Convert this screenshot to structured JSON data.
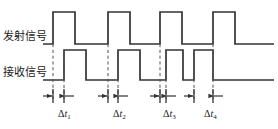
{
  "figure": {
    "background_color": "#ffffff",
    "stroke_color": "#333333",
    "dashed_color": "#555555"
  },
  "signals": {
    "transmit": {
      "label": "发射信号",
      "name": "transmit-signal",
      "baseline_y": 44,
      "high_y": 12,
      "start_x": 43,
      "end_x": 274,
      "pulses": [
        {
          "rise_x": 53,
          "fall_x": 75
        },
        {
          "rise_x": 108,
          "fall_x": 130
        },
        {
          "rise_x": 160,
          "fall_x": 182
        },
        {
          "rise_x": 213,
          "fall_x": 235
        }
      ]
    },
    "receive": {
      "label": "接收信号",
      "name": "receive-signal",
      "baseline_y": 80,
      "high_y": 50,
      "start_x": 43,
      "end_x": 274,
      "pulses": [
        {
          "rise_x": 64,
          "fall_x": 86
        },
        {
          "rise_x": 118,
          "fall_x": 140
        },
        {
          "rise_x": 166,
          "fall_x": 183
        },
        {
          "rise_x": 194,
          "fall_x": 213
        }
      ]
    }
  },
  "dashed_guides": [
    {
      "x": 53,
      "y_top": 44,
      "y_bottom": 99
    },
    {
      "x": 108,
      "y_top": 44,
      "y_bottom": 99
    },
    {
      "x": 160,
      "y_top": 44,
      "y_bottom": 99
    },
    {
      "x": 213,
      "y_top": 44,
      "y_bottom": 99
    },
    {
      "x": 64,
      "y_top": 50,
      "y_bottom": 99
    },
    {
      "x": 118,
      "y_top": 50,
      "y_bottom": 99
    },
    {
      "x": 166,
      "y_top": 50,
      "y_bottom": 99
    },
    {
      "x": 194,
      "y_top": 50,
      "y_bottom": 99
    }
  ],
  "dimension_row": {
    "y": 96,
    "ticks": [
      53,
      64,
      108,
      118,
      160,
      166,
      194,
      213
    ],
    "intervals": [
      {
        "id": "dt1",
        "from_x": 53,
        "to_x": 64,
        "label_x": 58,
        "label_y": 108,
        "delta": "Δ",
        "var": "t",
        "sub": "1"
      },
      {
        "id": "dt2",
        "from_x": 108,
        "to_x": 118,
        "label_x": 113,
        "label_y": 108,
        "delta": "Δ",
        "var": "t",
        "sub": "2"
      },
      {
        "id": "dt3",
        "from_x": 160,
        "to_x": 166,
        "label_x": 163,
        "label_y": 108,
        "delta": "Δ",
        "var": "t",
        "sub": "3"
      },
      {
        "id": "dt4",
        "from_x": 194,
        "to_x": 213,
        "label_x": 204,
        "label_y": 108,
        "delta": "Δ",
        "var": "t",
        "sub": "4"
      }
    ]
  },
  "dt_labels": {
    "dt1": {
      "delta": "Δ",
      "var": "t",
      "sub": "1"
    },
    "dt2": {
      "delta": "Δ",
      "var": "t",
      "sub": "2"
    },
    "dt3": {
      "delta": "Δ",
      "var": "t",
      "sub": "3"
    },
    "dt4": {
      "delta": "Δ",
      "var": "t",
      "sub": "4"
    }
  }
}
